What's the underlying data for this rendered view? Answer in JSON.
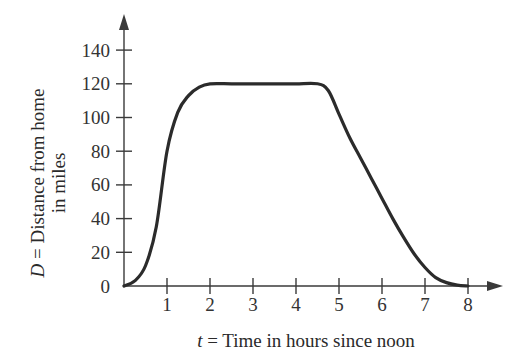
{
  "chart_data": {
    "type": "line",
    "title": "",
    "xlabel": "t = Time in hours since noon",
    "xlabel_var": "t",
    "xlabel_rest": " = Time in hours since noon",
    "ylabel": "D = Distance from home in miles",
    "ylabel_line1_var": "D",
    "ylabel_line1_rest": " = Distance from home",
    "ylabel_line2": "in miles",
    "x_ticks": [
      1,
      2,
      3,
      4,
      5,
      6,
      7,
      8
    ],
    "y_ticks": [
      0,
      20,
      40,
      60,
      80,
      100,
      120,
      140
    ],
    "xlim": [
      0,
      8.8
    ],
    "ylim": [
      0,
      160
    ],
    "grid": false,
    "legend": null,
    "series": [
      {
        "name": "D(t)",
        "x": [
          0,
          0.25,
          0.5,
          0.75,
          1.0,
          1.25,
          1.5,
          1.75,
          2.0,
          2.5,
          3.0,
          3.5,
          4.0,
          4.5,
          4.75,
          5.0,
          5.25,
          5.5,
          5.75,
          6.0,
          6.25,
          6.5,
          6.75,
          7.0,
          7.25,
          7.5,
          7.75,
          8.0
        ],
        "values": [
          0,
          3,
          12,
          35,
          80,
          103,
          113,
          118,
          120,
          120,
          120,
          120,
          120,
          120,
          116,
          102,
          88,
          76,
          64,
          52,
          40,
          29,
          19,
          11,
          5,
          2,
          0.5,
          0
        ]
      }
    ],
    "colors": {
      "curve": "#2b2b2b",
      "axis": "#3a3a3a",
      "text": "#333333"
    }
  }
}
